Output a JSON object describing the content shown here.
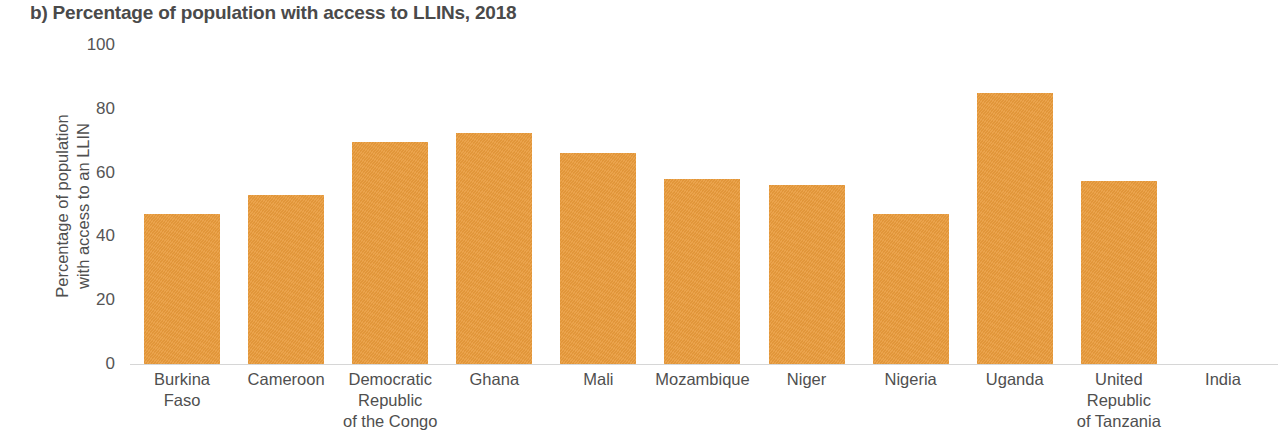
{
  "chart_data": {
    "type": "bar",
    "title": "b) Percentage of population with access to LLINs, 2018",
    "xlabel": "",
    "ylabel": "Percentage of population with access to an LLIN",
    "ylabel_lines": [
      "Percentage of population",
      "with access to an LLIN"
    ],
    "ylim": [
      0,
      100
    ],
    "yticks": [
      100,
      80,
      60,
      40,
      20,
      0
    ],
    "ytick_labels": [
      "100",
      "80",
      "60",
      "40",
      "20",
      "0"
    ],
    "grid": false,
    "legend": null,
    "bar_color": "#e99b3c",
    "axis_color": "#d6d6d6",
    "text_color": "#4f4f4f",
    "title_color": "#4a4a4a",
    "categories": [
      "Burkina Faso",
      "Cameroon",
      "Democratic Republic of the Congo",
      "Ghana",
      "Mali",
      "Mozambique",
      "Niger",
      "Nigeria",
      "Uganda",
      "United Republic of Tanzania",
      "India"
    ],
    "category_label_lines": [
      [
        "Burkina",
        "Faso"
      ],
      [
        "Cameroon"
      ],
      [
        "Democratic",
        "Republic",
        "of the Congo"
      ],
      [
        "Ghana"
      ],
      [
        "Mali"
      ],
      [
        "Mozambique"
      ],
      [
        "Niger"
      ],
      [
        "Nigeria"
      ],
      [
        "Uganda"
      ],
      [
        "United",
        "Republic",
        "of Tanzania"
      ],
      [
        "India"
      ]
    ],
    "values": [
      47,
      53,
      69.5,
      72.5,
      66,
      58,
      56,
      47,
      85,
      57.5,
      0
    ]
  }
}
